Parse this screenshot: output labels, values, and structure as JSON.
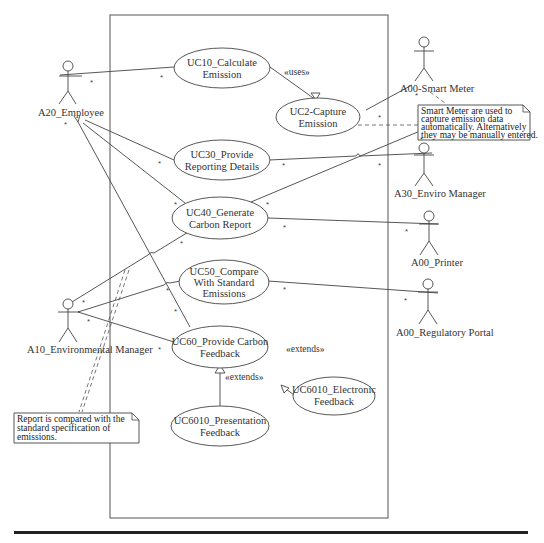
{
  "diagram": {
    "type": "UML Use Case Diagram",
    "actors": [
      {
        "id": "A20",
        "label": "A20_Employee"
      },
      {
        "id": "A00_SM",
        "label": "A00-Smart Meter"
      },
      {
        "id": "A30",
        "label": "A30_Enviro Manager"
      },
      {
        "id": "A00_PR",
        "label": "A00_Printer"
      },
      {
        "id": "A00_RP",
        "label": "A00_Regulatory Portal"
      },
      {
        "id": "A10",
        "label": "A10_Environmental Manager"
      }
    ],
    "use_cases": [
      {
        "id": "UC10",
        "line1": "UC10_Calculate",
        "line2": "Emission"
      },
      {
        "id": "UC2",
        "line1": "UC2-Capture",
        "line2": "Emission"
      },
      {
        "id": "UC30",
        "line1": "UC30_Provide",
        "line2": "Reporting Details"
      },
      {
        "id": "UC40",
        "line1": "UC40_Generate",
        "line2": "Carbon Report"
      },
      {
        "id": "UC50",
        "line1": "UC50_Compare",
        "line2": "With Standard",
        "line3": "Emissions"
      },
      {
        "id": "UC60",
        "line1": "UC60_Provide Carbon",
        "line2": "Feedback"
      },
      {
        "id": "UC6010E",
        "line1": "UC6010_Electronic",
        "line2": "Feedback"
      },
      {
        "id": "UC6010P",
        "line1": "UC6010_Presentation",
        "line2": "Feedback"
      }
    ],
    "stereotypes": {
      "uses": "«uses»",
      "extends_electronic": "«extends»",
      "extends_presentation": "«extends»"
    },
    "notes": {
      "smart_meter": {
        "line1": "Smart Meter are used to",
        "line2": "capture emission data",
        "line3": "automatically. Alternatively",
        "line4": "they may be manually entered."
      },
      "report": {
        "line1": "Report is compared with the",
        "line2": "standard specification of",
        "line3": "emissions."
      }
    },
    "multiplicity": "*",
    "relationships": [
      {
        "from": "A20",
        "to": "UC10"
      },
      {
        "from": "A20",
        "to": "UC30"
      },
      {
        "from": "A20",
        "to": "UC40"
      },
      {
        "from": "A20",
        "to": "UC60"
      },
      {
        "from": "UC10",
        "to": "UC2",
        "type": "uses"
      },
      {
        "from": "UC2",
        "to": "A00_SM"
      },
      {
        "from": "UC30",
        "to": "A30"
      },
      {
        "from": "UC40",
        "to": "A00_SM"
      },
      {
        "from": "UC40",
        "to": "A00_PR"
      },
      {
        "from": "UC50",
        "to": "A00_RP"
      },
      {
        "from": "A10",
        "to": "UC40"
      },
      {
        "from": "A10",
        "to": "UC50"
      },
      {
        "from": "A10",
        "to": "UC60"
      },
      {
        "from": "UC6010E",
        "to": "UC60",
        "type": "extends"
      },
      {
        "from": "UC6010P",
        "to": "UC60",
        "type": "extends"
      }
    ]
  }
}
